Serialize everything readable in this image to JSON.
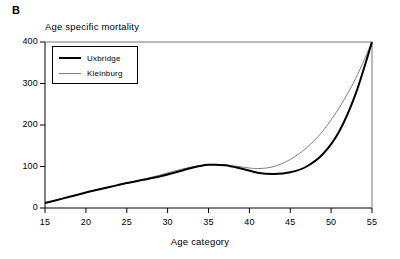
{
  "panel": {
    "label": "B"
  },
  "chart_data": {
    "type": "line",
    "title": "Age specific mortality",
    "xlabel": "Age category",
    "ylabel": "",
    "xlim": [
      15,
      55
    ],
    "ylim": [
      0,
      400
    ],
    "xticks": [
      15,
      20,
      25,
      30,
      35,
      40,
      45,
      50,
      55
    ],
    "xtick_labels": [
      "15",
      "20",
      "25",
      "30",
      "35",
      "40",
      "45",
      "50",
      "55"
    ],
    "yticks": [
      0,
      100,
      200,
      300,
      400
    ],
    "ytick_labels": [
      "0",
      "100",
      "200",
      "300",
      "400"
    ],
    "grid": false,
    "legend_position": "upper left",
    "series": [
      {
        "name": "Uxbridge",
        "color": "#000000",
        "width": 2.0,
        "x": [
          15,
          17,
          19,
          21,
          23,
          25,
          27,
          29,
          31,
          33,
          35,
          37,
          39,
          41,
          43,
          45,
          47,
          49,
          51,
          53,
          55
        ],
        "values": [
          12,
          22,
          32,
          42,
          51,
          60,
          68,
          76,
          86,
          97,
          104,
          103,
          95,
          85,
          82,
          86,
          100,
          130,
          185,
          275,
          400
        ]
      },
      {
        "name": "Kleinburg",
        "color": "#808080",
        "width": 1.0,
        "x": [
          15,
          17,
          19,
          21,
          23,
          25,
          27,
          29,
          31,
          33,
          35,
          37,
          39,
          41,
          43,
          45,
          47,
          49,
          51,
          53,
          55
        ],
        "values": [
          12,
          22,
          32,
          42,
          51,
          60,
          69,
          79,
          90,
          99,
          105,
          104,
          99,
          95,
          100,
          117,
          145,
          186,
          242,
          312,
          400
        ]
      }
    ]
  },
  "legend": {
    "entries": [
      {
        "label": "Uxbridge"
      },
      {
        "label": "Kleinburg"
      }
    ]
  },
  "colors": {
    "axis": "#000000",
    "uxbridge": "#000000",
    "kleinburg": "#808080",
    "background": "#ffffff"
  }
}
